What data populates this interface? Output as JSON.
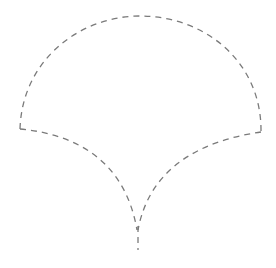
{
  "figure": {
    "stroke_color": "#7a7a7a",
    "stroke_width": "1.3",
    "dash_pattern": "6 5",
    "background": "#ffffff"
  },
  "shape": {
    "top_arc": "M20 129 C 22 60, 80 16, 140 16 C 205 16, 262 62, 261 132",
    "left_inner_curve": "M20 129 C 75 134, 125 160, 137 230",
    "right_inner_curve": "M261 132 C 205 140, 150 165, 138 230",
    "stem": "M138 226 L 138 250"
  }
}
